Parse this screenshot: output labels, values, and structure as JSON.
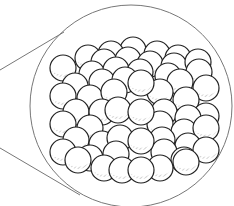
{
  "diagram": {
    "title": "",
    "colors": {
      "stroke": "#222222",
      "fill": "#ffffff",
      "shade": "#b8b8b8",
      "lens": "#777777"
    },
    "lens": {
      "cx": 131,
      "cy": 106,
      "r": 101
    },
    "pointer_lines": [
      {
        "x1": 0,
        "y1": 70,
        "x2": 64,
        "y2": 32
      },
      {
        "x1": 0,
        "y1": 148,
        "x2": 80,
        "y2": 195
      }
    ],
    "sphere_radius": 13,
    "spheres": [
      [
        133,
        50
      ],
      [
        157,
        54
      ],
      [
        111,
        54
      ],
      [
        178,
        58
      ],
      [
        88,
        58
      ],
      [
        104,
        62
      ],
      [
        128,
        60
      ],
      [
        150,
        64
      ],
      [
        174,
        66
      ],
      [
        198,
        62
      ],
      [
        63,
        68
      ],
      [
        92,
        74
      ],
      [
        116,
        70
      ],
      [
        140,
        72
      ],
      [
        168,
        76
      ],
      [
        199,
        72
      ],
      [
        75,
        86
      ],
      [
        102,
        82
      ],
      [
        125,
        80
      ],
      [
        180,
        82
      ],
      [
        206,
        88
      ],
      [
        63,
        96
      ],
      [
        90,
        98
      ],
      [
        114,
        92
      ],
      [
        160,
        92
      ],
      [
        186,
        100
      ],
      [
        206,
        116
      ],
      [
        76,
        112
      ],
      [
        102,
        112
      ],
      [
        164,
        112
      ],
      [
        188,
        118
      ],
      [
        63,
        124
      ],
      [
        90,
        128
      ],
      [
        118,
        110
      ],
      [
        160,
        124
      ],
      [
        184,
        132
      ],
      [
        206,
        128
      ],
      [
        76,
        140
      ],
      [
        102,
        144
      ],
      [
        120,
        138
      ],
      [
        162,
        140
      ],
      [
        188,
        146
      ],
      [
        63,
        152
      ],
      [
        90,
        158
      ],
      [
        116,
        154
      ],
      [
        164,
        152
      ],
      [
        184,
        160
      ],
      [
        206,
        150
      ],
      [
        78,
        160
      ],
      [
        104,
        168
      ],
      [
        122,
        170
      ],
      [
        160,
        168
      ],
      [
        186,
        162
      ],
      [
        141,
        83
      ],
      [
        141,
        112
      ],
      [
        141,
        141
      ],
      [
        141,
        170
      ]
    ]
  }
}
